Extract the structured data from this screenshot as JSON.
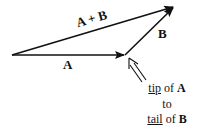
{
  "diagram": {
    "labels": {
      "sum": "A + B",
      "a": "A",
      "b": "B"
    },
    "note": {
      "line1_u": "tip",
      "line1_mid": " of ",
      "line1_b": "A",
      "line2": "to",
      "line3_u": "tail",
      "line3_mid": " of ",
      "line3_b": "B"
    },
    "vectors": [
      {
        "name": "A",
        "from": [
          12,
          55
        ],
        "to": [
          125,
          55
        ]
      },
      {
        "name": "B",
        "from": [
          125,
          55
        ],
        "to": [
          174,
          7
        ]
      },
      {
        "name": "A + B",
        "from": [
          12,
          55
        ],
        "to": [
          174,
          7
        ]
      }
    ],
    "colors": {
      "stroke": "#111111",
      "text": "#111111"
    }
  }
}
